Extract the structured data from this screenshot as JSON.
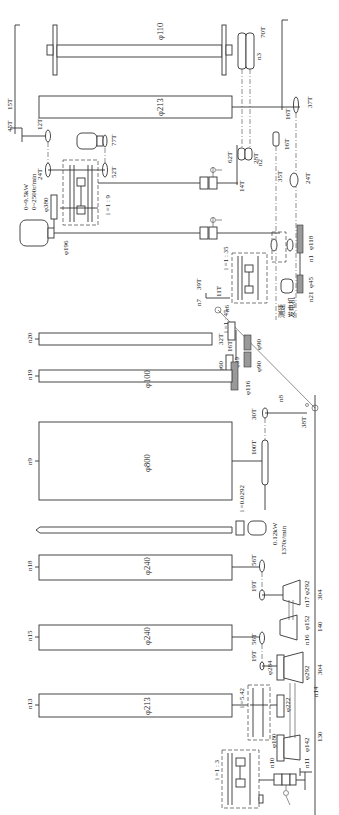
{
  "diagram": {
    "orientation": "rotated-90-ccw",
    "rollers": [
      {
        "id": "roller-phi110",
        "label": "φ110"
      },
      {
        "id": "roller-top-phi213",
        "label": "φ213"
      },
      {
        "id": "roller-n20",
        "speed_label": "n20"
      },
      {
        "id": "roller-n19",
        "speed_label": "n19",
        "label": "φ100"
      },
      {
        "id": "drum-n9",
        "speed_label": "n9",
        "label": "φ800"
      },
      {
        "id": "roller-n18",
        "speed_label": "n18",
        "label": "φ240"
      },
      {
        "id": "roller-n15",
        "speed_label": "n15",
        "label": "φ240"
      },
      {
        "id": "roller-n13",
        "speed_label": "n13",
        "label": "φ213"
      }
    ],
    "main_motor": {
      "power": "0~9.5kW",
      "speed": "0~2500r/min",
      "pulley_large": "φ380",
      "pulley_small": "φ196"
    },
    "small_motor": {
      "power": "0.12kW",
      "speed": "1370r/min",
      "ratio": "i =0.0292"
    },
    "tachogenerator": {
      "label_line1": "测速",
      "label_line2": "发电机",
      "speed_label": "n21",
      "pulley": "φ45"
    },
    "gearboxes": [
      {
        "id": "gearbox-1-9",
        "ratio": "i =1 : 9"
      },
      {
        "id": "gearbox-1-35",
        "ratio": "i =1 : 35"
      },
      {
        "id": "gearbox-1-45",
        "ratio": "i =1 : 45"
      },
      {
        "id": "gearbox-5-42",
        "ratio": "i =5.42"
      },
      {
        "id": "gearbox-1-3",
        "ratio": "i =1 : 3"
      }
    ],
    "gears": {
      "g45T": "45T",
      "g15T": "15T",
      "g12T": "12T",
      "g77T": "77T",
      "g24T_a": "24T",
      "g52T": "52T",
      "g70T": "70T",
      "g28T": "28T",
      "g62T": "62T",
      "g14T": "14T",
      "g16T_a": "16T",
      "g16T_b": "16T",
      "g37T": "37T",
      "g35T": "35T",
      "g24T_b": "24T",
      "g39T": "39T",
      "g11T": "11T",
      "g32T": "32T",
      "g16T_c": "16T",
      "g30T": "30T",
      "g100T": "100T",
      "g38T": "38T",
      "g56T_a": "56T",
      "g19T_a": "19T",
      "g56T_b": "56T",
      "g19T_b": "19T"
    },
    "pulleys": {
      "p118": "φ118",
      "p60": "φ60",
      "p39": "φ39",
      "p90a": "φ90",
      "p90b": "φ90",
      "p116": "φ116",
      "p292a": "φ292",
      "p152": "φ152",
      "p284": "φ284",
      "p292b": "φ292",
      "p222": "φ222",
      "p180": "φ180",
      "p142": "φ142"
    },
    "dimensions": {
      "d304a": "304",
      "d140": "140",
      "d304b": "304",
      "d130": "130"
    },
    "speed_labels": {
      "n1": "n1",
      "n2": "n2",
      "n3": "n3",
      "n6": "n6",
      "n7": "n7",
      "n8": "n8",
      "n10": "n10",
      "n11": "n11",
      "n14": "n14",
      "n16": "n16",
      "n17": "n17"
    }
  }
}
